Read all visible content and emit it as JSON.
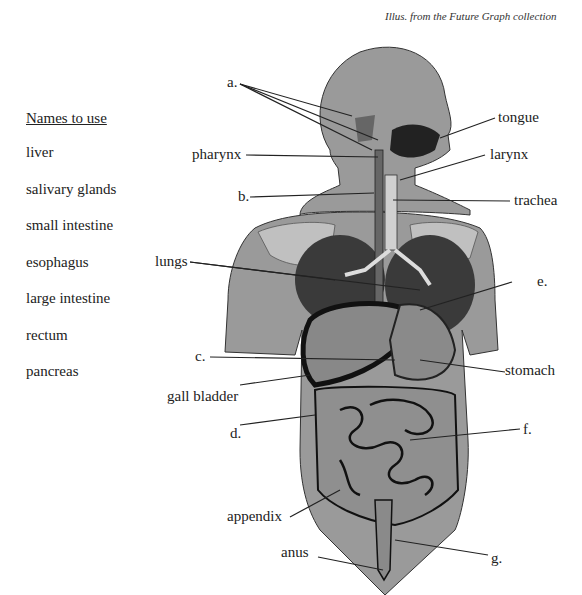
{
  "credit": "Illus. from the Future Graph collection",
  "names_to_use": {
    "heading": "Names to use",
    "items": [
      "liver",
      "salivary glands",
      "small intestine",
      "esophagus",
      "large intestine",
      "rectum",
      "pancreas"
    ]
  },
  "labels": {
    "a": "a.",
    "tongue": "tongue",
    "pharynx": "pharynx",
    "larynx": "larynx",
    "b": "b.",
    "trachea": "trachea",
    "lungs": "lungs",
    "e": "e.",
    "c": "c.",
    "stomach": "stomach",
    "gall_bladder": "gall bladder",
    "d": "d.",
    "f": "f.",
    "appendix": "appendix",
    "anus": "anus",
    "g": "g."
  },
  "colors": {
    "body": "#9a9a9a",
    "dark_organ": "#3a3a3a",
    "light": "#c8c8c8",
    "line": "#222222"
  }
}
